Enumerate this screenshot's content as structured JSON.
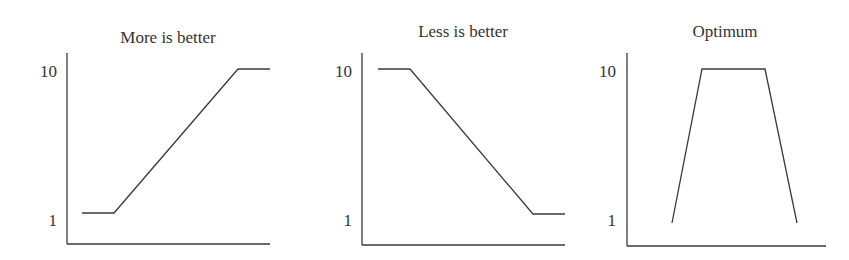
{
  "figure": {
    "line_color": "#3a3a3a",
    "text_color": "#333333",
    "background": "#ffffff"
  },
  "chart_data": [
    {
      "type": "line",
      "title": "More is better",
      "xlabel": "",
      "ylabel": "",
      "yticks": [
        "1",
        "10"
      ],
      "ylim": [
        1,
        10
      ],
      "description": "Flat at 1, rises linearly, then flat at 10",
      "series": [
        {
          "name": "value function",
          "points": [
            [
              0.0,
              1
            ],
            [
              0.16,
              1
            ],
            [
              1.0,
              10
            ],
            [
              1.16,
              10
            ]
          ]
        }
      ],
      "px": {
        "axis_x": 67,
        "axis_top": 53,
        "axis_bottom": 244,
        "axis_right": 270,
        "title_x": 168,
        "title_y": 43,
        "tick10_y": 77,
        "tick1_y": 226,
        "tick_label_right": 57,
        "points": [
          [
            82,
            213
          ],
          [
            114,
            213
          ],
          [
            238,
            69
          ],
          [
            270,
            69
          ]
        ]
      }
    },
    {
      "type": "line",
      "title": "Less is better",
      "xlabel": "",
      "ylabel": "",
      "yticks": [
        "1",
        "10"
      ],
      "ylim": [
        1,
        10
      ],
      "description": "Flat at 10, falls linearly, then flat at 1",
      "series": [
        {
          "name": "value function",
          "points": [
            [
              0.0,
              10
            ],
            [
              0.16,
              10
            ],
            [
              1.0,
              1
            ],
            [
              1.16,
              1
            ]
          ]
        }
      ],
      "px": {
        "axis_x": 362,
        "axis_top": 53,
        "axis_bottom": 245,
        "axis_right": 565,
        "title_x": 463,
        "title_y": 37,
        "tick10_y": 77,
        "tick1_y": 226,
        "tick_label_right": 352,
        "points": [
          [
            378,
            69
          ],
          [
            410,
            69
          ],
          [
            533,
            214
          ],
          [
            565,
            214
          ]
        ]
      }
    },
    {
      "type": "line",
      "title": "Optimum",
      "xlabel": "",
      "ylabel": "",
      "yticks": [
        "1",
        "10"
      ],
      "ylim": [
        1,
        10
      ],
      "description": "Rises steeply from 1 to 10, plateau at 10, then falls steeply back to 1",
      "series": [
        {
          "name": "value function",
          "points": [
            [
              0.0,
              1
            ],
            [
              0.22,
              10
            ],
            [
              0.68,
              10
            ],
            [
              0.9,
              1
            ]
          ]
        }
      ],
      "px": {
        "axis_x": 627,
        "axis_top": 53,
        "axis_bottom": 246,
        "axis_right": 826,
        "title_x": 725,
        "title_y": 37,
        "tick10_y": 77,
        "tick1_y": 226,
        "tick_label_right": 616,
        "points": [
          [
            672,
            223
          ],
          [
            702,
            69
          ],
          [
            765,
            69
          ],
          [
            797,
            223
          ]
        ]
      }
    }
  ]
}
